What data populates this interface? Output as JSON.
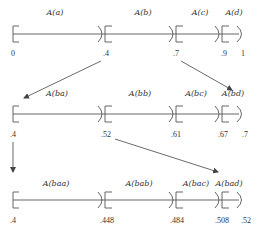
{
  "diagram": {
    "type": "interval-subdivision",
    "rows": [
      {
        "id": "row-1",
        "line_y": 34,
        "header_y": 15,
        "tick_y": 56,
        "x_start": 13,
        "x_end": 245,
        "segments": [
          {
            "label": "A(a)",
            "label_x": 55
          },
          {
            "label": "A(b)",
            "label_x": 143
          },
          {
            "label": "A(c)",
            "label_x": 200
          },
          {
            "label": "A(d)",
            "label_x": 234
          }
        ],
        "dividers_x": [
          104,
          175,
          221
        ],
        "ticks": [
          {
            "text": "0",
            "x": 13
          },
          {
            "text": ".4",
            "x": 106
          },
          {
            "text": ".7",
            "x": 176
          },
          {
            "text": ".9",
            "x": 224
          },
          {
            "text": "1",
            "x": 243
          }
        ]
      },
      {
        "id": "row-2",
        "line_y": 114,
        "header_y": 96,
        "tick_y": 137,
        "x_start": 13,
        "x_end": 245,
        "segments": [
          {
            "label": "A(ba)",
            "label_x": 57
          },
          {
            "label": "A(bb)",
            "label_x": 140
          },
          {
            "label": "A(bc)",
            "label_x": 196
          },
          {
            "label": "A(bd)",
            "label_x": 233
          }
        ],
        "dividers_x": [
          104,
          175,
          221
        ],
        "ticks": [
          {
            "text": ".4",
            "x": 13
          },
          {
            "text": ".52",
            "x": 106
          },
          {
            "text": ".61",
            "x": 176
          },
          {
            "text": ".67",
            "x": 223
          },
          {
            "text": ".7",
            "x": 245
          }
        ]
      },
      {
        "id": "row-3",
        "line_y": 200,
        "header_y": 186,
        "tick_y": 223,
        "x_start": 13,
        "x_end": 245,
        "segments": [
          {
            "label": "A(baa)",
            "label_x": 56
          },
          {
            "label": "A(bab)",
            "label_x": 139
          },
          {
            "label": "A(bac)",
            "label_x": 196
          },
          {
            "label": "A(bad)",
            "label_x": 229
          }
        ],
        "dividers_x": [
          104,
          175,
          221
        ],
        "ticks": [
          {
            "text": ".4",
            "x": 13
          },
          {
            "text": ".448",
            "x": 107
          },
          {
            "text": ".484",
            "x": 177
          },
          {
            "text": ".508",
            "x": 222
          },
          {
            "text": ".52",
            "x": 246
          }
        ]
      }
    ],
    "arrows": [
      {
        "from": "row-1 tick .4",
        "to": "row-2 start",
        "x1": 101,
        "y1": 61,
        "x2": 24,
        "y2": 98
      },
      {
        "from": "row-1 tick .7",
        "to": "row-2 end",
        "x1": 181,
        "y1": 61,
        "x2": 232,
        "y2": 90
      },
      {
        "from": "row-2 start",
        "to": "row-3 start",
        "x1": 13,
        "y1": 142,
        "x2": 13,
        "y2": 172
      },
      {
        "from": "row-2 tick .52",
        "to": "row-3 end",
        "x1": 115,
        "y1": 139,
        "x2": 218,
        "y2": 172
      }
    ]
  }
}
